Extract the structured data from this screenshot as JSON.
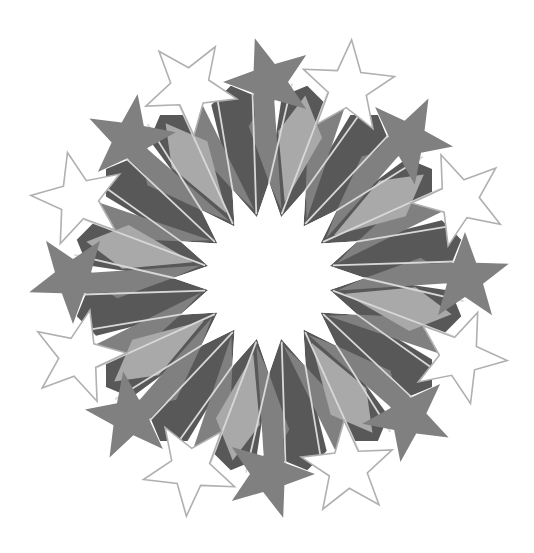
{
  "artwork": {
    "title": "Geometric Star Rosette",
    "description": "Sixteen-fold rotationally symmetric Islamic geometric star rosette",
    "canvas": {
      "width": 534,
      "height": 553,
      "background_color": "#ffffff"
    },
    "center": {
      "x": 269,
      "y": 278
    },
    "symmetry_order": 16,
    "palette": {
      "background": "#ffffff",
      "dark_gray": "#585858",
      "mid_gray": "#808080",
      "light_gray": "#a9a9a9",
      "pale_gray": "#b4b4b4",
      "outline_stroke": "#b0b0b0",
      "white_fill": "#ffffff",
      "seam_line": "#d8d8d8"
    },
    "geometry": {
      "center_star_points": 16,
      "center_star_outer_radius": 96,
      "center_star_inner_radius": 62,
      "inner_ring_radius": 96,
      "mid_ring_radius": 150,
      "outer_ring_radius": 196,
      "solid_star_center_radius": 196,
      "solid_star_outer_radius": 46,
      "solid_star_inner_radius": 19,
      "hollow_star_center_radius": 206,
      "hollow_star_outer_radius": 48,
      "hollow_star_inner_radius": 20,
      "outline_stroke_width": 1.6,
      "seam_stroke_width": 1.8
    },
    "components": [
      {
        "name": "center-star-void",
        "count": 1,
        "fill": "#ffffff",
        "shape": "16-point star"
      },
      {
        "name": "dark-pentagon-ring",
        "count": 16,
        "fill": "#585858",
        "shape": "irregular pentagon"
      },
      {
        "name": "mid-gray-kite-ring",
        "count": 16,
        "fill": "#808080",
        "shape": "kite"
      },
      {
        "name": "light-gray-kite-ring",
        "count": 8,
        "fill": "#a9a9a9",
        "shape": "kite"
      },
      {
        "name": "solid-gray-star-ring",
        "count": 8,
        "fill": "#808080",
        "shape": "5-point star"
      },
      {
        "name": "hollow-outline-star-ring",
        "count": 8,
        "fill": "#ffffff",
        "stroke": "#b0b0b0",
        "shape": "5-point star"
      }
    ]
  }
}
